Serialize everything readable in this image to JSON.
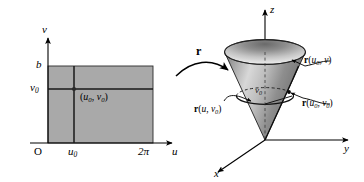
{
  "figure": {
    "colors": {
      "rect_fill": "#a9a9a9",
      "rect_stroke": "#1a1a1a",
      "cone_light": "#efefef",
      "cone_mid": "#b5b5b5",
      "cone_dark": "#6f6f6f",
      "axis": "#000000",
      "curve": "#000000"
    }
  },
  "left_panel": {
    "name": "uv-parameter-domain",
    "axes": {
      "vertical_label": "v",
      "horizontal_label": "u",
      "origin_label": "O"
    },
    "ticks": {
      "v_top": "b",
      "v_zero": "v",
      "v_zero_sub": "0",
      "u_zero": "u",
      "u_zero_sub": "0",
      "u_max": "2π"
    },
    "point_label": {
      "open": "(",
      "u": "u",
      "u_sub": "0",
      "comma": ", ",
      "v": "v",
      "v_sub": "0",
      "close": ")"
    }
  },
  "map_arrow": {
    "name": "mapping-arrow",
    "label": "r"
  },
  "right_panel": {
    "name": "cone-surface-3d",
    "axes": {
      "z_label": "z",
      "y_label": "y",
      "x_label": "x"
    },
    "inner_label": {
      "v": "v",
      "v_sub": "0"
    },
    "callouts": [
      {
        "id": "r-u0-v",
        "bold": "r",
        "open": "(",
        "first": "u",
        "first_sub": "0",
        "comma": ", ",
        "second": "v",
        "second_sub": "",
        "close": ")"
      },
      {
        "id": "r-u0-v0",
        "bold": "r",
        "open": "(",
        "first": "u",
        "first_sub": "0",
        "comma": ", ",
        "second": "v",
        "second_sub": "0",
        "close": ")"
      },
      {
        "id": "r-u-v0",
        "bold": "r",
        "open": "(",
        "first": "u",
        "first_sub": "",
        "comma": ", ",
        "second": "v",
        "second_sub": "0",
        "close": ")"
      }
    ]
  }
}
